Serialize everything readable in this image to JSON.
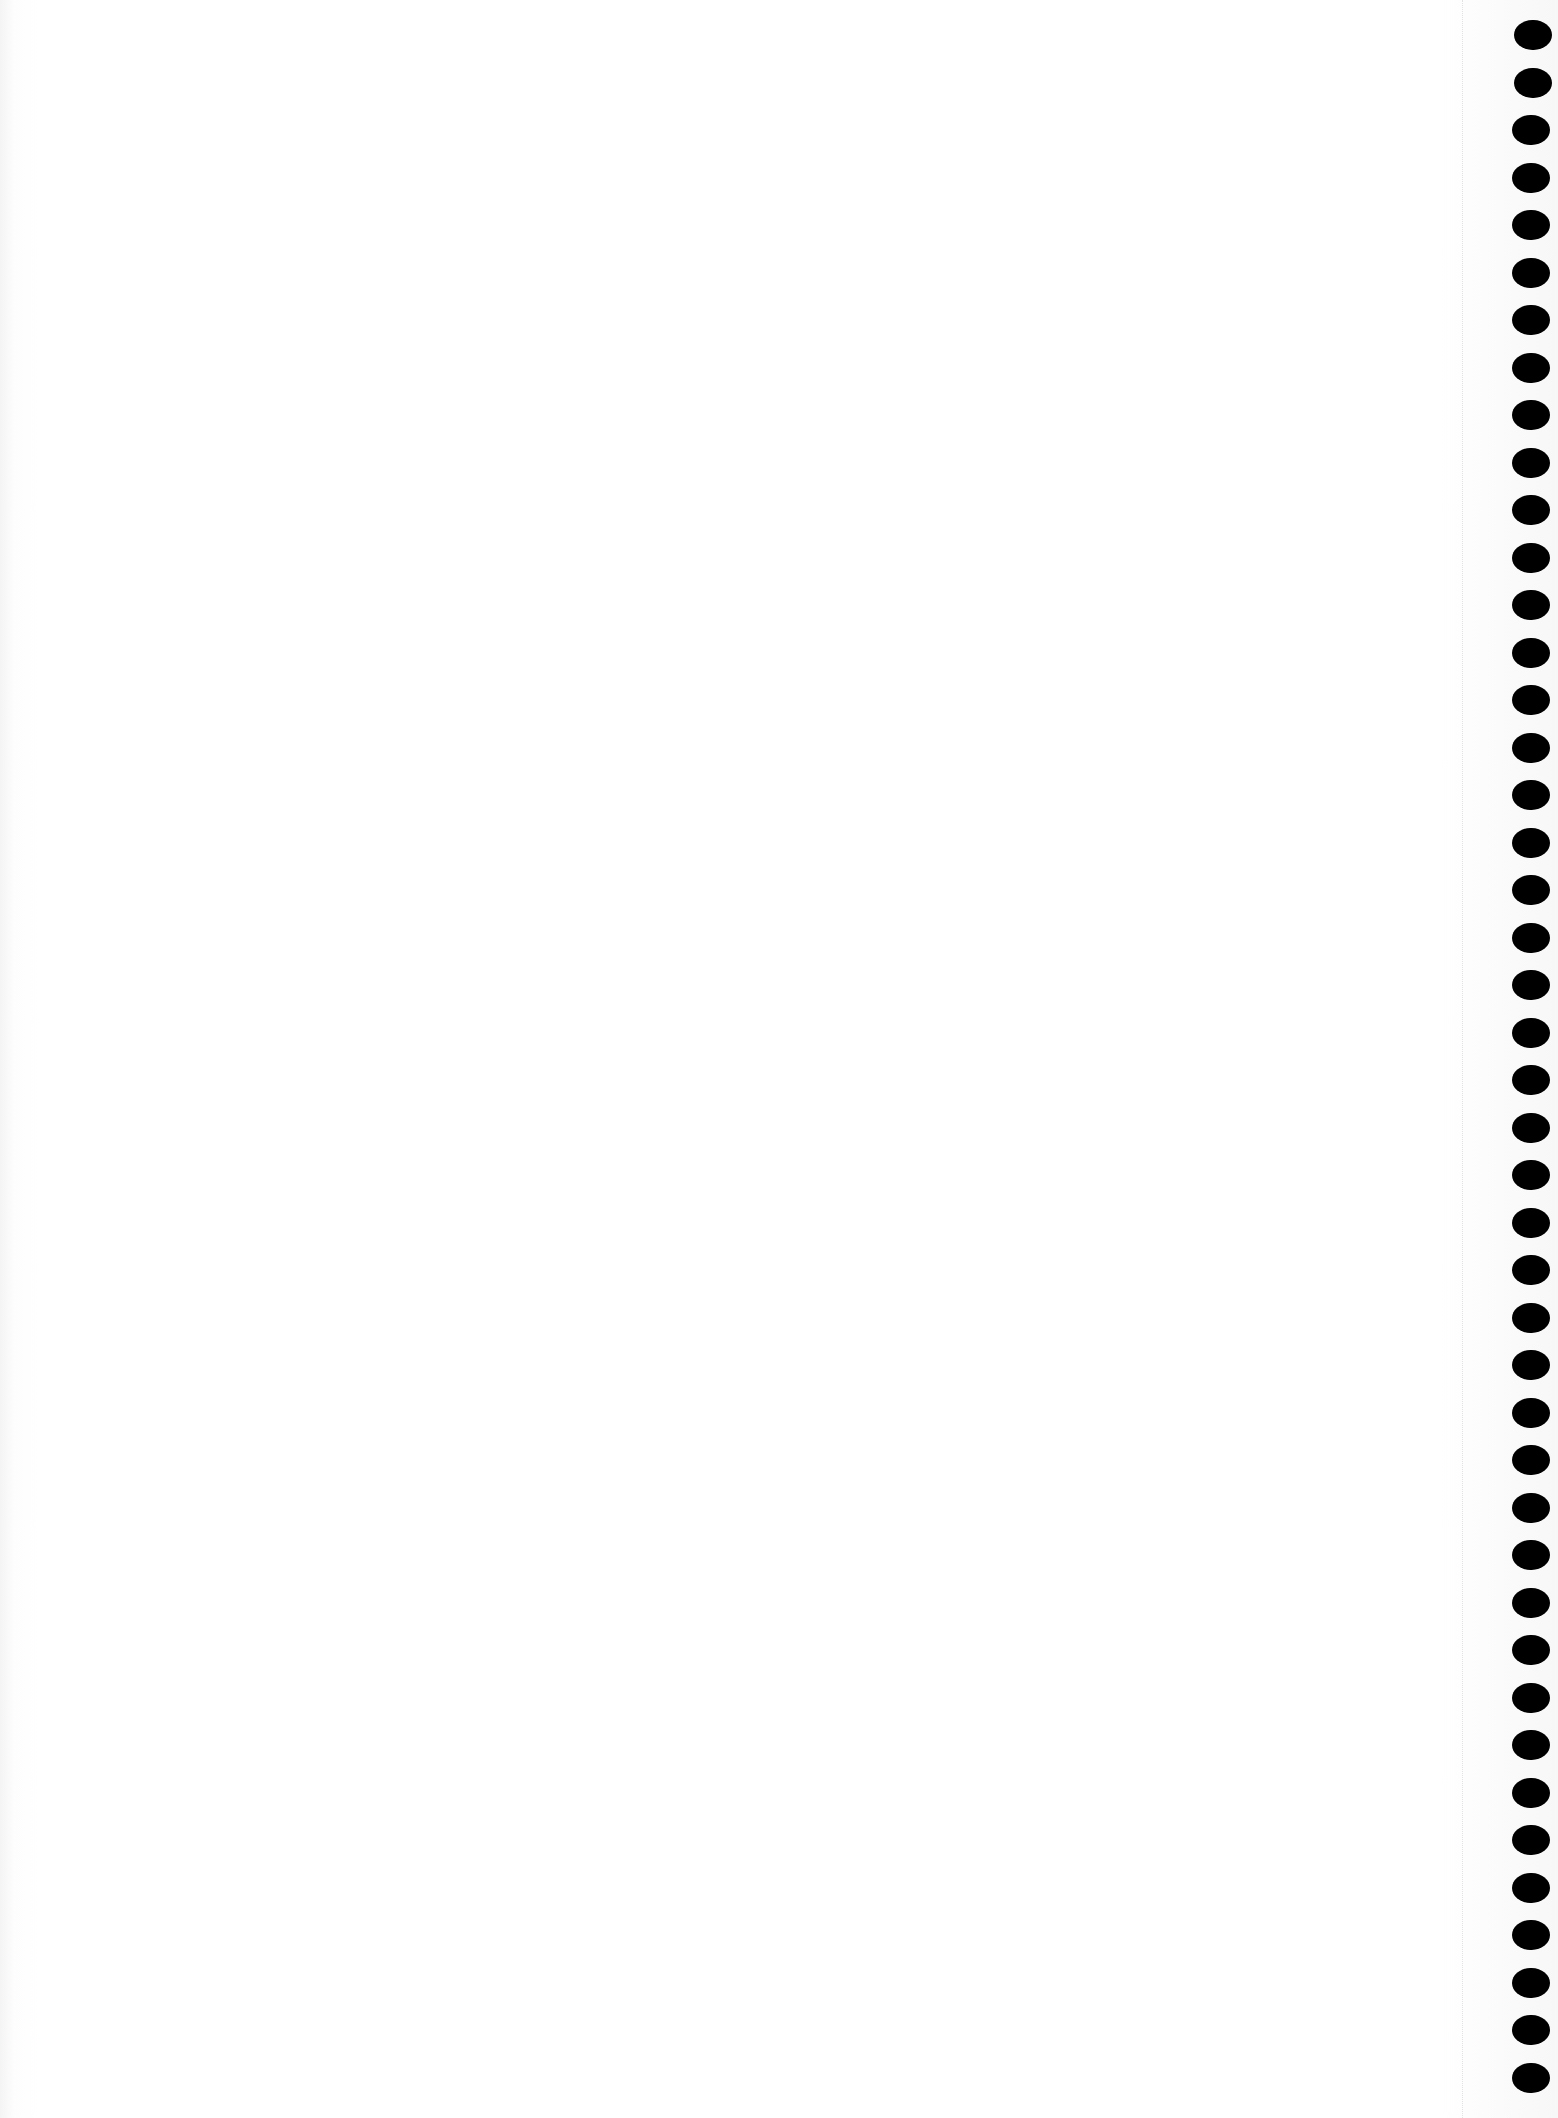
{
  "page": {
    "type": "blank spiral notebook page",
    "background_color": "#ffffff",
    "hole_color": "#000000",
    "binding_side": "right",
    "hole_count": 44,
    "hole_spacing_px": 47.5,
    "first_hole_y": 20,
    "text": ""
  }
}
